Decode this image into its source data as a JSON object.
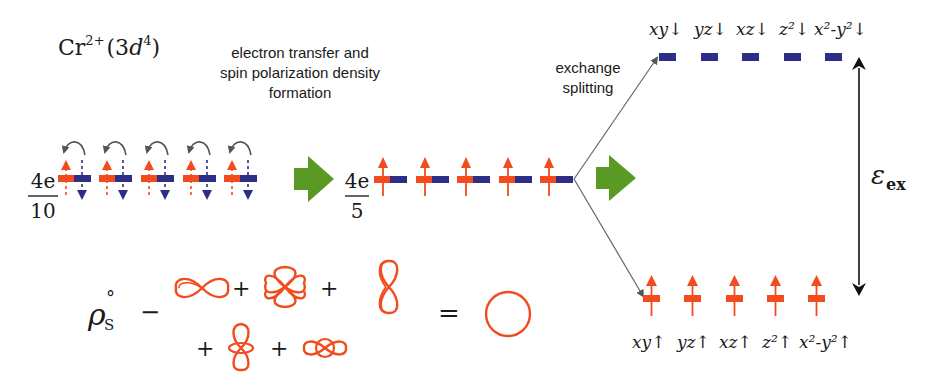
{
  "colors": {
    "spin_up": "#f24b1e",
    "spin_down": "#2d2f86",
    "transition_arrow": "#5a9a24",
    "line": "#555555",
    "text": "#1a1a1a"
  },
  "ion_label": {
    "element": "Cr",
    "charge": "2+",
    "config_open": "(3",
    "config_orbital": "d",
    "config_exp": "4",
    "config_close": ")"
  },
  "step1_caption": {
    "line1": "electron transfer and",
    "line2": "spin polarization density",
    "line3": "formation"
  },
  "step2_caption": {
    "line1": "exchange",
    "line2": "splitting"
  },
  "left_occupancy": {
    "numerator": "4e",
    "denominator": "10",
    "orbital_count": 5
  },
  "middle_occupancy": {
    "numerator": "4e",
    "denominator": "5",
    "orbital_count": 5
  },
  "spin_down_levels": {
    "labels": [
      "xy↓",
      "yz↓",
      "xz↓",
      "z²↓",
      "x²-y²↓"
    ]
  },
  "spin_up_levels": {
    "labels": [
      "xy↑",
      "yz↑",
      "xz↑",
      "z²↑",
      "x²-y²↑"
    ]
  },
  "exchange_energy": {
    "symbol": "ε",
    "subscript": "ex"
  },
  "density_equation": {
    "lhs_symbol": "ρ",
    "lhs_subscript": "S",
    "lhs_superscript": "°",
    "relation": "−",
    "plus": "+",
    "equals": "=",
    "orbital_shapes_row1": [
      "dxy-lobes-horizontal",
      "cloverleaf-four-lobes",
      "dumbbell-vertical"
    ],
    "orbital_shapes_row2": [
      "dz2-with-torus",
      "dx2y2-horizontal-with-ring"
    ],
    "result_shape": "sphere-circle"
  }
}
